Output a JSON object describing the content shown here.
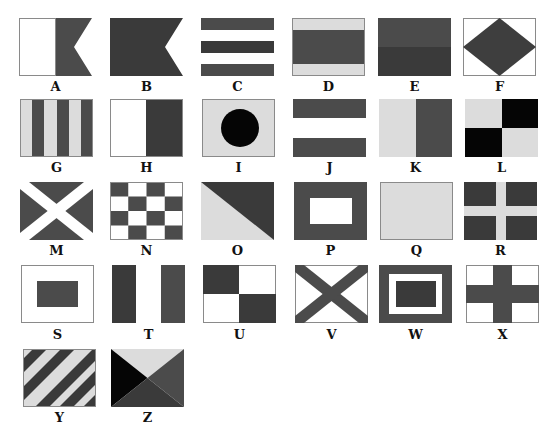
{
  "colors": {
    "white": "#ffffff",
    "light": "#dcdcdc",
    "mid": "#4b4b4b",
    "dark": "#3a3a3a",
    "black": "#050505",
    "border": "#8a8a8a"
  },
  "flags": [
    {
      "letter": "A",
      "design": "white hoist, swallow-tailed dark fly"
    },
    {
      "letter": "B",
      "design": "solid dark swallow-tailed"
    },
    {
      "letter": "C",
      "design": "five horizontal stripes dark/white/dark/white/dark"
    },
    {
      "letter": "D",
      "design": "light / dark / light horizontal bands"
    },
    {
      "letter": "E",
      "design": "mid over dark horizontal halves"
    },
    {
      "letter": "F",
      "design": "dark diamond on white"
    },
    {
      "letter": "G",
      "design": "six vertical stripes light/dark"
    },
    {
      "letter": "H",
      "design": "white hoist, dark fly vertical halves"
    },
    {
      "letter": "I",
      "design": "black circle on light field"
    },
    {
      "letter": "J",
      "design": "dark / white / dark horizontal bands"
    },
    {
      "letter": "K",
      "design": "light hoist, dark fly vertical halves"
    },
    {
      "letter": "L",
      "design": "light and black quarters"
    },
    {
      "letter": "M",
      "design": "white saltire on dark"
    },
    {
      "letter": "N",
      "design": "4x4 dark and white checkers"
    },
    {
      "letter": "O",
      "design": "light lower-left, dark upper-right diagonal"
    },
    {
      "letter": "P",
      "design": "white rectangle on dark"
    },
    {
      "letter": "Q",
      "design": "solid light"
    },
    {
      "letter": "R",
      "design": "light cross on dark"
    },
    {
      "letter": "S",
      "design": "dark rectangle on white"
    },
    {
      "letter": "T",
      "design": "dark / white / dark vertical bands"
    },
    {
      "letter": "U",
      "design": "dark and white quarters"
    },
    {
      "letter": "V",
      "design": "dark saltire on white"
    },
    {
      "letter": "W",
      "design": "dark border, white ring, dark center"
    },
    {
      "letter": "X",
      "design": "dark cross on white"
    },
    {
      "letter": "Y",
      "design": "diagonal light and dark stripes"
    },
    {
      "letter": "Z",
      "design": "four triangles: light top, black hoist, mid fly, dark bottom"
    }
  ]
}
